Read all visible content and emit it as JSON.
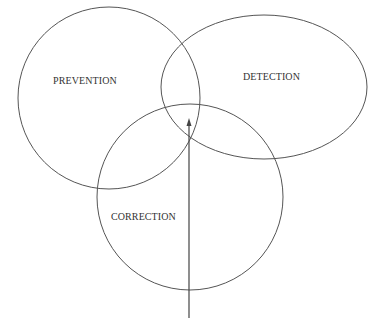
{
  "diagram": {
    "type": "venn",
    "stroke_color": "#555555",
    "text_color": "#333333",
    "sets": [
      {
        "id": "prevention",
        "label": "PREVENTION",
        "shape": "circle",
        "cx": 109,
        "cy": 98,
        "r": 91,
        "label_x": 53,
        "label_y": 84
      },
      {
        "id": "detection",
        "label": "DETECTION",
        "shape": "ellipse",
        "cx": 264,
        "cy": 87,
        "rx": 103,
        "ry": 72,
        "label_x": 243,
        "label_y": 80
      },
      {
        "id": "correction",
        "label": "CORRECTION",
        "shape": "circle",
        "cx": 190,
        "cy": 197,
        "r": 93,
        "label_x": 111,
        "label_y": 220
      }
    ],
    "arrow": {
      "direction": "up",
      "x": 189,
      "y_start": 318,
      "y_end": 118,
      "points_to": "center-intersection"
    }
  }
}
